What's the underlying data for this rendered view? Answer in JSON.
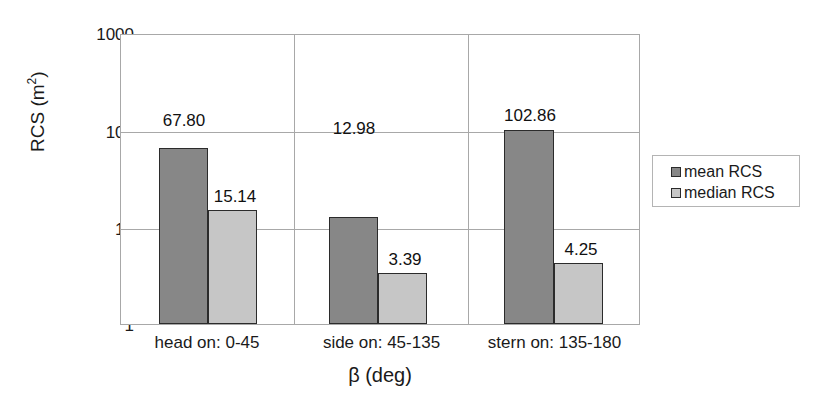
{
  "chart_data": {
    "type": "bar",
    "title": "",
    "subtitle": "",
    "xlabel": "β (deg)",
    "ylabel": "RCS (m²)",
    "ylabel_base": "RCS (m",
    "ylabel_exponent": "2",
    "ylabel_close": ")",
    "categories": [
      "head on:  0-45",
      "side on: 45-135",
      "stern on: 135-180"
    ],
    "yscale": "log",
    "ylim": [
      1,
      1000
    ],
    "yticks": [
      "1000",
      "100",
      "10",
      "1"
    ],
    "ytick_values": [
      1000,
      100,
      10,
      1
    ],
    "grid": "horizontal-and-category-separators",
    "legend_position": "right-outside",
    "series": [
      {
        "name": "mean RCS",
        "color": "#878787",
        "values": [
          67.8,
          12.98,
          102.86
        ],
        "labels": [
          "67.80",
          "12.98",
          "102.86"
        ]
      },
      {
        "name": "median RCS",
        "color": "#c6c6c6",
        "values": [
          15.14,
          3.39,
          4.25
        ],
        "labels": [
          "15.14",
          "3.39",
          "4.25"
        ]
      }
    ]
  },
  "legend": {
    "items": [
      {
        "label": "mean RCS",
        "swatch_class": "mean"
      },
      {
        "label": "median RCS",
        "swatch_class": "median"
      }
    ]
  },
  "colors": {
    "mean_bar": "#878787",
    "median_bar": "#c6c6c6",
    "bar_outline": "#2b2b2b",
    "gridline": "#a8a8a8",
    "background": "#ffffff",
    "text": "#1a1a1a"
  }
}
